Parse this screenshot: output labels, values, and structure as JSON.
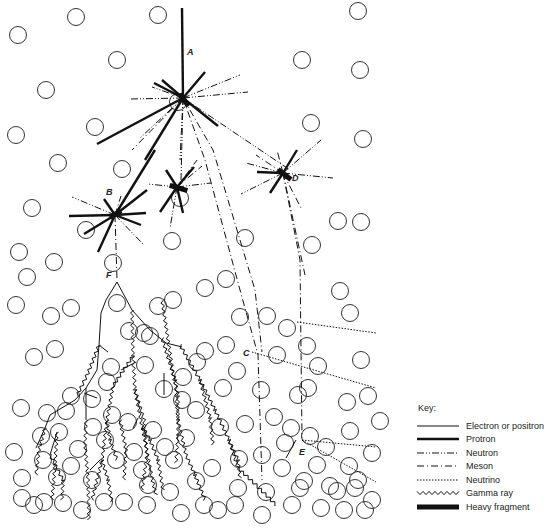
{
  "labels": [
    {
      "id": "A",
      "text": "A",
      "x": 187,
      "y": 55
    },
    {
      "id": "B",
      "text": "B",
      "x": 106,
      "y": 195
    },
    {
      "id": "C",
      "text": "C",
      "x": 243,
      "y": 356
    },
    {
      "id": "D",
      "text": "D",
      "x": 292,
      "y": 181
    },
    {
      "id": "E",
      "text": "E",
      "x": 299,
      "y": 455
    },
    {
      "id": "F",
      "text": "F",
      "x": 106,
      "y": 278
    }
  ],
  "key": {
    "title": "Key:",
    "items": [
      {
        "label": "Electron or positron",
        "style": "electron"
      },
      {
        "label": "Protron",
        "style": "proton"
      },
      {
        "label": "Neutron",
        "style": "neutron"
      },
      {
        "label": "Meson",
        "style": "meson"
      },
      {
        "label": "Neutrino",
        "style": "neutrino"
      },
      {
        "label": "Gamma ray",
        "style": "gamma"
      },
      {
        "label": "Heavy fragment",
        "style": "heavy"
      }
    ]
  },
  "styles": {
    "electron": {
      "w": 1,
      "dash": ""
    },
    "proton": {
      "w": 2.4,
      "dash": ""
    },
    "neutron": {
      "w": 1,
      "dash": "7 2 1 2 1 2"
    },
    "meson": {
      "w": 1,
      "dash": "7 3 1 3"
    },
    "neutrino": {
      "w": 1,
      "dash": "1.5 1.5"
    },
    "heavy": {
      "w": 5,
      "dash": ""
    }
  },
  "atoms": [
    [
      18,
      35
    ],
    [
      76,
      17
    ],
    [
      158,
      15
    ],
    [
      358,
      11
    ],
    [
      46,
      90
    ],
    [
      117,
      60
    ],
    [
      302,
      60
    ],
    [
      95,
      127
    ],
    [
      16,
      135
    ],
    [
      58,
      163
    ],
    [
      360,
      70
    ],
    [
      311,
      123
    ],
    [
      363,
      139
    ],
    [
      122,
      169
    ],
    [
      178,
      102
    ],
    [
      32,
      208
    ],
    [
      27,
      277
    ],
    [
      19,
      252
    ],
    [
      86,
      230
    ],
    [
      338,
      221
    ],
    [
      361,
      222
    ],
    [
      226,
      279
    ],
    [
      205,
      288
    ],
    [
      340,
      291
    ],
    [
      312,
      245
    ],
    [
      245,
      238
    ],
    [
      172,
      241
    ],
    [
      54,
      262
    ],
    [
      113,
      263
    ],
    [
      180,
      198
    ],
    [
      173,
      300
    ],
    [
      158,
      306
    ],
    [
      117,
      303
    ],
    [
      144,
      333
    ],
    [
      16,
      305
    ],
    [
      71,
      308
    ],
    [
      55,
      349
    ],
    [
      92,
      399
    ],
    [
      71,
      396
    ],
    [
      111,
      367
    ],
    [
      129,
      331
    ],
    [
      240,
      317
    ],
    [
      267,
      316
    ],
    [
      287,
      328
    ],
    [
      350,
      313
    ],
    [
      307,
      346
    ],
    [
      277,
      355
    ],
    [
      318,
      366
    ],
    [
      361,
      360
    ],
    [
      237,
      371
    ],
    [
      226,
      345
    ],
    [
      205,
      351
    ],
    [
      182,
      400
    ],
    [
      164,
      389
    ],
    [
      145,
      365
    ],
    [
      183,
      377
    ],
    [
      197,
      362
    ],
    [
      107,
      382
    ],
    [
      34,
      357
    ],
    [
      51,
      316
    ],
    [
      261,
      390
    ],
    [
      223,
      388
    ],
    [
      150,
      336
    ],
    [
      245,
      424
    ],
    [
      274,
      417
    ],
    [
      298,
      395
    ],
    [
      347,
      402
    ],
    [
      368,
      396
    ],
    [
      308,
      388
    ],
    [
      291,
      428
    ],
    [
      350,
      431
    ],
    [
      380,
      421
    ],
    [
      310,
      436
    ],
    [
      317,
      465
    ],
    [
      349,
      466
    ],
    [
      372,
      453
    ],
    [
      330,
      486
    ],
    [
      355,
      488
    ],
    [
      372,
      500
    ],
    [
      358,
      480
    ],
    [
      285,
      443
    ],
    [
      282,
      468
    ],
    [
      266,
      492
    ],
    [
      238,
      488
    ],
    [
      212,
      468
    ],
    [
      239,
      459
    ],
    [
      220,
      427
    ],
    [
      196,
      410
    ],
    [
      186,
      438
    ],
    [
      165,
      447
    ],
    [
      153,
      430
    ],
    [
      174,
      460
    ],
    [
      196,
      481
    ],
    [
      170,
      492
    ],
    [
      148,
      485
    ],
    [
      142,
      470
    ],
    [
      134,
      452
    ],
    [
      116,
      460
    ],
    [
      105,
      440
    ],
    [
      93,
      427
    ],
    [
      78,
      449
    ],
    [
      71,
      466
    ],
    [
      57,
      477
    ],
    [
      43,
      460
    ],
    [
      22,
      478
    ],
    [
      14,
      452
    ],
    [
      21,
      408
    ],
    [
      41,
      436
    ],
    [
      66,
      411
    ],
    [
      44,
      502
    ],
    [
      63,
      503
    ],
    [
      82,
      510
    ],
    [
      104,
      502
    ],
    [
      124,
      502
    ],
    [
      147,
      505
    ],
    [
      181,
      513
    ],
    [
      204,
      505
    ],
    [
      218,
      510
    ],
    [
      235,
      505
    ],
    [
      262,
      515
    ],
    [
      292,
      505
    ],
    [
      321,
      508
    ],
    [
      344,
      510
    ],
    [
      365,
      510
    ],
    [
      34,
      505
    ],
    [
      22,
      498
    ],
    [
      128,
      422
    ],
    [
      112,
      415
    ],
    [
      300,
      488
    ],
    [
      262,
      455
    ],
    [
      304,
      481
    ],
    [
      326,
      447
    ],
    [
      337,
      491
    ],
    [
      92,
      480
    ],
    [
      59,
      432
    ],
    [
      47,
      413
    ]
  ],
  "tracks": {
    "proton": [
      [
        [
          182,
          8
        ],
        [
          183,
          98
        ]
      ],
      [
        [
          183,
          98
        ],
        [
          97,
          144
        ]
      ],
      [
        [
          183,
          98
        ],
        [
          145,
          160
        ]
      ],
      [
        [
          183,
          98
        ],
        [
          218,
          126
        ]
      ],
      [
        [
          183,
          98
        ],
        [
          154,
          83
        ]
      ],
      [
        [
          183,
          98
        ],
        [
          205,
          72
        ]
      ],
      [
        [
          183,
          98
        ],
        [
          162,
          80
        ]
      ],
      [
        [
          115,
          215
        ],
        [
          155,
          150
        ]
      ],
      [
        [
          115,
          215
        ],
        [
          69,
          216
        ]
      ],
      [
        [
          115,
          215
        ],
        [
          84,
          234
        ]
      ],
      [
        [
          115,
          215
        ],
        [
          98,
          252
        ]
      ],
      [
        [
          115,
          215
        ],
        [
          146,
          213
        ]
      ],
      [
        [
          115,
          215
        ],
        [
          141,
          225
        ]
      ],
      [
        [
          115,
          215
        ],
        [
          104,
          199
        ]
      ],
      [
        [
          115,
          215
        ],
        [
          147,
          190
        ]
      ],
      [
        [
          177,
          187
        ],
        [
          160,
          212
        ]
      ],
      [
        [
          177,
          187
        ],
        [
          183,
          213
        ]
      ],
      [
        [
          177,
          187
        ],
        [
          194,
          167
        ]
      ],
      [
        [
          177,
          187
        ],
        [
          166,
          170
        ]
      ],
      [
        [
          283,
          173
        ],
        [
          257,
          172
        ]
      ],
      [
        [
          283,
          173
        ],
        [
          297,
          150
        ]
      ],
      [
        [
          283,
          173
        ],
        [
          270,
          193
        ]
      ]
    ],
    "neutron": [
      [
        [
          183,
          98
        ],
        [
          130,
          99
        ]
      ],
      [
        [
          183,
          98
        ],
        [
          248,
          92
        ]
      ],
      [
        [
          183,
          98
        ],
        [
          152,
          87
        ]
      ],
      [
        [
          183,
          98
        ],
        [
          240,
          75
        ]
      ],
      [
        [
          183,
          98
        ],
        [
          140,
          138
        ]
      ],
      [
        [
          183,
          98
        ],
        [
          180,
          160
        ]
      ],
      [
        [
          183,
          98
        ],
        [
          290,
          170
        ]
      ],
      [
        [
          183,
          98
        ],
        [
          181,
          180
        ]
      ],
      [
        [
          115,
          215
        ],
        [
          72,
          197
        ]
      ],
      [
        [
          115,
          215
        ],
        [
          143,
          244
        ]
      ],
      [
        [
          177,
          187
        ],
        [
          148,
          184
        ]
      ],
      [
        [
          177,
          187
        ],
        [
          211,
          183
        ]
      ],
      [
        [
          177,
          187
        ],
        [
          170,
          228
        ]
      ],
      [
        [
          283,
          173
        ],
        [
          333,
          178
        ]
      ],
      [
        [
          283,
          173
        ],
        [
          321,
          140
        ]
      ],
      [
        [
          283,
          173
        ],
        [
          241,
          194
        ]
      ],
      [
        [
          283,
          173
        ],
        [
          246,
          163
        ]
      ]
    ],
    "meson": [
      [
        [
          183,
          98
        ],
        [
          205,
          160
        ],
        [
          240,
          290
        ],
        [
          258,
          355
        ],
        [
          262,
          480
        ]
      ],
      [
        [
          183,
          98
        ],
        [
          132,
          150
        ]
      ],
      [
        [
          183,
          98
        ],
        [
          213,
          150
        ],
        [
          255,
          290
        ],
        [
          262,
          352
        ]
      ],
      [
        [
          115,
          215
        ],
        [
          121,
          196
        ]
      ],
      [
        [
          115,
          215
        ],
        [
          117,
          280
        ]
      ],
      [
        [
          283,
          173
        ],
        [
          300,
          260
        ],
        [
          302,
          438
        ]
      ],
      [
        [
          283,
          173
        ],
        [
          256,
          155
        ]
      ],
      [
        [
          283,
          173
        ],
        [
          277,
          150
        ]
      ],
      [
        [
          283,
          173
        ],
        [
          301,
          208
        ]
      ],
      [
        [
          283,
          173
        ],
        [
          305,
          275
        ]
      ],
      [
        [
          177,
          187
        ],
        [
          197,
          160
        ]
      ],
      [
        [
          177,
          187
        ],
        [
          202,
          166
        ]
      ]
    ],
    "neutrino": [
      [
        [
          297,
          322
        ],
        [
          376,
          333
        ]
      ],
      [
        [
          252,
          352
        ],
        [
          376,
          388
        ]
      ],
      [
        [
          302,
          440
        ],
        [
          376,
          447
        ]
      ],
      [
        [
          302,
          440
        ],
        [
          376,
          482
        ]
      ]
    ],
    "electron": [
      [
        [
          117,
          282
        ],
        [
          106,
          300
        ],
        [
          101,
          313
        ],
        [
          99,
          345
        ],
        [
          97,
          370
        ],
        [
          86,
          388
        ],
        [
          75,
          400
        ],
        [
          50,
          415
        ],
        [
          45,
          428
        ]
      ],
      [
        [
          117,
          282
        ],
        [
          132,
          310
        ],
        [
          150,
          330
        ],
        [
          166,
          343
        ],
        [
          182,
          347
        ]
      ],
      [
        [
          296,
          440
        ],
        [
          286,
          458
        ]
      ],
      [
        [
          86,
          388
        ],
        [
          86,
          420
        ]
      ],
      [
        [
          99,
          345
        ],
        [
          108,
          352
        ]
      ],
      [
        [
          97,
          398
        ],
        [
          84,
          393
        ]
      ],
      [
        [
          57,
          432
        ],
        [
          50,
          455
        ]
      ],
      [
        [
          45,
          428
        ],
        [
          36,
          448
        ]
      ],
      [
        [
          121,
          370
        ],
        [
          136,
          362
        ]
      ],
      [
        [
          164,
          373
        ],
        [
          164,
          395
        ]
      ],
      [
        [
          133,
          428
        ],
        [
          138,
          418
        ]
      ],
      [
        [
          100,
          460
        ],
        [
          90,
          470
        ]
      ]
    ],
    "gamma": [
      [
        [
          132,
          310
        ],
        [
          133,
          356
        ],
        [
          135,
          390
        ],
        [
          142,
          426
        ],
        [
          152,
          478
        ]
      ],
      [
        [
          162,
          338
        ],
        [
          175,
          380
        ],
        [
          178,
          420
        ],
        [
          186,
          455
        ]
      ],
      [
        [
          180,
          345
        ],
        [
          200,
          380
        ],
        [
          215,
          410
        ],
        [
          229,
          440
        ],
        [
          238,
          468
        ],
        [
          256,
          485
        ],
        [
          276,
          505
        ]
      ],
      [
        [
          133,
          356
        ],
        [
          113,
          386
        ],
        [
          107,
          420
        ],
        [
          102,
          460
        ],
        [
          92,
          500
        ]
      ],
      [
        [
          99,
          345
        ],
        [
          88,
          373
        ],
        [
          77,
          396
        ]
      ],
      [
        [
          135,
          390
        ],
        [
          144,
          420
        ],
        [
          147,
          455
        ],
        [
          142,
          490
        ]
      ],
      [
        [
          142,
          426
        ],
        [
          150,
          440
        ],
        [
          158,
          460
        ],
        [
          163,
          490
        ]
      ],
      [
        [
          175,
          380
        ],
        [
          178,
          396
        ],
        [
          178,
          435
        ],
        [
          176,
          463
        ]
      ],
      [
        [
          86,
          420
        ],
        [
          85,
          445
        ],
        [
          88,
          480
        ],
        [
          89,
          520
        ]
      ],
      [
        [
          57,
          432
        ],
        [
          55,
          465
        ],
        [
          52,
          500
        ]
      ],
      [
        [
          45,
          428
        ],
        [
          39,
          450
        ],
        [
          36,
          475
        ]
      ],
      [
        [
          50,
          455
        ],
        [
          63,
          480
        ],
        [
          62,
          500
        ]
      ],
      [
        [
          102,
          460
        ],
        [
          108,
          480
        ],
        [
          112,
          502
        ]
      ],
      [
        [
          120,
          420
        ],
        [
          126,
          450
        ],
        [
          124,
          480
        ]
      ],
      [
        [
          152,
          478
        ],
        [
          156,
          495
        ]
      ],
      [
        [
          229,
          440
        ],
        [
          238,
          460
        ],
        [
          240,
          478
        ]
      ],
      [
        [
          200,
          380
        ],
        [
          210,
          418
        ],
        [
          213,
          445
        ]
      ],
      [
        [
          107,
          420
        ],
        [
          110,
          440
        ],
        [
          117,
          460
        ]
      ],
      [
        [
          186,
          455
        ],
        [
          195,
          475
        ],
        [
          205,
          500
        ]
      ],
      [
        [
          162,
          300
        ],
        [
          174,
          380
        ]
      ]
    ],
    "heavy": [
      [
        [
          181,
          96
        ],
        [
          187,
          104
        ]
      ],
      [
        [
          112,
          216
        ],
        [
          119,
          212
        ]
      ],
      [
        [
          172,
          186
        ],
        [
          185,
          190
        ]
      ],
      [
        [
          280,
          171
        ],
        [
          289,
          178
        ]
      ]
    ]
  }
}
